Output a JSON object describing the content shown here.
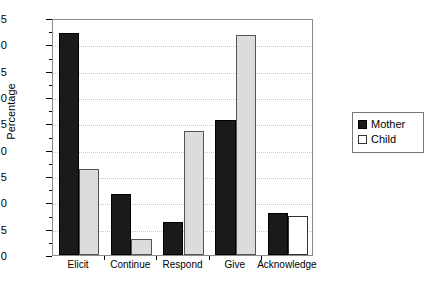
{
  "chart_data": {
    "type": "bar",
    "title": "",
    "subtitle": "",
    "xlabel": "",
    "ylabel": "Percentage",
    "ylim": [
      0,
      45
    ],
    "ytick_step": 5,
    "minor_ticks": true,
    "grid": true,
    "grid_style": "dotted",
    "grid_axis": "y",
    "legend_position": "right",
    "categories": [
      "Elicit",
      "Continue",
      "Respond",
      "Give",
      "Acknowledge"
    ],
    "ytick_labels": [
      "0",
      "5",
      "10",
      "15",
      "20",
      "25",
      "30",
      "35",
      "40",
      "45"
    ],
    "series": [
      {
        "name": "Mother",
        "color": "#1a1a1a",
        "values": [
          42.2,
          11.6,
          6.3,
          25.6,
          8.0
        ]
      },
      {
        "name": "Child",
        "color": "#dcdcdc",
        "values": [
          16.3,
          3.0,
          23.5,
          41.7,
          7.5
        ]
      }
    ]
  },
  "legend": {
    "entries": [
      {
        "label": "Mother",
        "swatch": "filled-black-swatch"
      },
      {
        "label": "Child",
        "swatch": "empty-white-swatch"
      }
    ]
  },
  "axes": {
    "y_title": "Percentage"
  }
}
